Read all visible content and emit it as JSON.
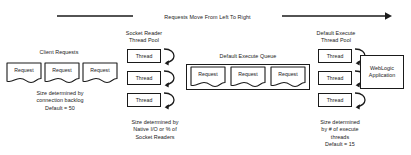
{
  "diagram": {
    "flow_arrow_label": "Requests Move From Left To Right",
    "client_requests": {
      "title": "Client Requests",
      "items": [
        {
          "label": "Request"
        },
        {
          "label": "Request"
        },
        {
          "label": "Request"
        }
      ],
      "caption": "Size determined by\nconnection backlog\nDefault = 50"
    },
    "socket_reader_pool": {
      "title": "Socket Reader\nThread Pool",
      "threads": [
        {
          "label": "Thread"
        },
        {
          "label": "Thread"
        },
        {
          "label": "Thread"
        }
      ],
      "caption": "Size determined by\nNative I/O or % of\nSocket Readers"
    },
    "execute_queue": {
      "title": "Default Execute Queue",
      "items": [
        {
          "label": "Request"
        },
        {
          "label": "Request"
        },
        {
          "label": "Request"
        }
      ]
    },
    "execute_thread_pool": {
      "title": "Default Execute\nThread Pool",
      "threads": [
        {
          "label": "Thread"
        },
        {
          "label": "Thread"
        },
        {
          "label": "Thread"
        }
      ],
      "caption": "Size determined\nby # of execute\nthreads\nDefault = 15"
    },
    "application": {
      "label": "WebLogic\nApplication"
    },
    "colors": {
      "stroke": "#1a1a1a",
      "fill": "#ffffff",
      "background": "#ffffff"
    }
  }
}
